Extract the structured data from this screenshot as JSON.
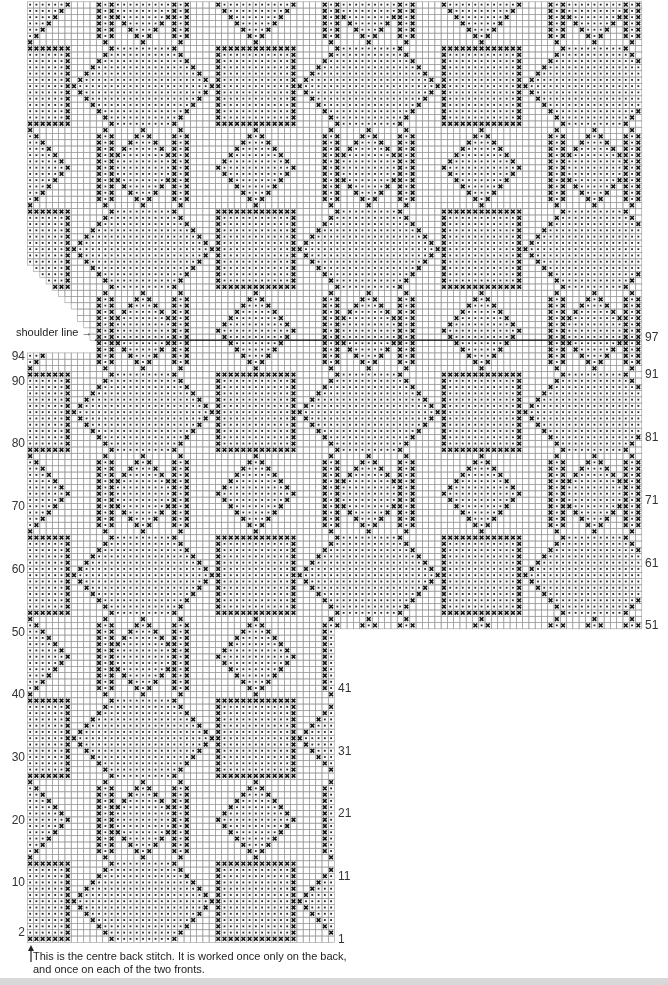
{
  "chart_data": {
    "type": "table",
    "subtitle": "",
    "xlabel": "",
    "ylabel": "row",
    "grid": true,
    "cell_px": 6.27,
    "origin_x": 27,
    "bottom_y": 942,
    "symbols": {
      "x": "contrast stitch (cross)",
      "dot": "background dotted stitch",
      "blank": "plain stitch"
    },
    "left_labels": [
      {
        "row": 2,
        "label": "2"
      },
      {
        "row": 10,
        "label": "10"
      },
      {
        "row": 20,
        "label": "20"
      },
      {
        "row": 30,
        "label": "30"
      },
      {
        "row": 40,
        "label": "40"
      },
      {
        "row": 50,
        "label": "50"
      },
      {
        "row": 60,
        "label": "60"
      },
      {
        "row": 70,
        "label": "70"
      },
      {
        "row": 80,
        "label": "80"
      },
      {
        "row": 90,
        "label": "90"
      },
      {
        "row": 94,
        "label": "94"
      }
    ],
    "right_labels_lower": [
      {
        "row": 1,
        "label": "1"
      },
      {
        "row": 11,
        "label": "11"
      },
      {
        "row": 21,
        "label": "21"
      },
      {
        "row": 31,
        "label": "31"
      },
      {
        "row": 41,
        "label": "41"
      }
    ],
    "right_labels_upper": [
      {
        "row": 51,
        "label": "51"
      },
      {
        "row": 61,
        "label": "61"
      },
      {
        "row": 71,
        "label": "71"
      },
      {
        "row": 81,
        "label": "81"
      },
      {
        "row": 91,
        "label": "91"
      },
      {
        "row": 97,
        "label": "97"
      }
    ],
    "shoulder_row": 97,
    "band_height": 13,
    "repeat_width": 36,
    "left_section": {
      "cols": [
        0,
        48
      ],
      "rows": [
        1,
        150
      ]
    },
    "right_section": {
      "cols": [
        49,
        97
      ],
      "rows": [
        51,
        150
      ]
    }
  },
  "labels": {
    "shoulder_line": "shoulder line",
    "note_line1": "This is the centre back stitch. It is worked once only on the back,",
    "note_line2": "and once on each of the two fronts."
  }
}
